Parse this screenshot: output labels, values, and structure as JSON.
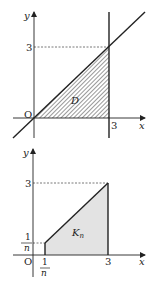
{
  "figure_top": {
    "axis_x_label": "x",
    "axis_y_label": "y",
    "origin_label": "O",
    "x_tick_label": "3",
    "y_tick_label": "3",
    "region_label": "D",
    "region_fill": "hatched",
    "description": "Region D bounded by y = x, x = 3 and the x-axis (0 ≤ y ≤ x ≤ 3)"
  },
  "figure_bottom": {
    "axis_x_label": "x",
    "axis_y_label": "y",
    "origin_label": "O",
    "x_tick_label": "3",
    "y_tick_label": "3",
    "x_tick_frac_num": "1",
    "x_tick_frac_den": "n",
    "y_tick_frac_num": "1",
    "y_tick_frac_den": "n",
    "region_label_main": "K",
    "region_label_sub": "n",
    "region_fill_color": "#e3e3e3",
    "description": "Region K_n bounded by x = 1/n, x = 3, y = x and the x-axis"
  },
  "colors": {
    "line": "#222222",
    "dash": "#555555",
    "shade": "#e3e3e3"
  }
}
